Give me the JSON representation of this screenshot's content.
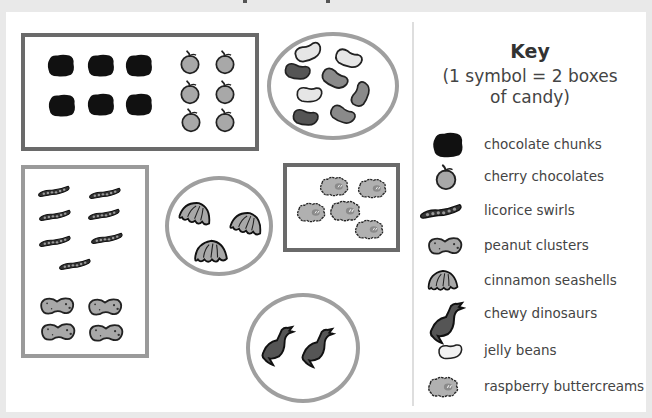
{
  "key": {
    "title": "Key",
    "scale_line1": "(1 symbol = 2 boxes",
    "scale_line2": "of candy)",
    "items": [
      {
        "icon": "chocolate-chunk-icon",
        "label": "chocolate chunks"
      },
      {
        "icon": "cherry-chocolate-icon",
        "label": "cherry chocolates"
      },
      {
        "icon": "licorice-swirl-icon",
        "label": "licorice swirls"
      },
      {
        "icon": "peanut-cluster-icon",
        "label": "peanut clusters"
      },
      {
        "icon": "cinnamon-seashell-icon",
        "label": "cinnamon seashells"
      },
      {
        "icon": "chewy-dinosaur-icon",
        "label": "chewy dinosaurs"
      },
      {
        "icon": "jelly-bean-icon",
        "label": "jelly beans"
      },
      {
        "icon": "raspberry-buttercream-icon",
        "label": "raspberry buttercreams"
      }
    ]
  },
  "groups": [
    {
      "container": "rectangle",
      "contents": [
        {
          "candy": "chocolate chunks",
          "symbols": 6
        },
        {
          "candy": "cherry chocolates",
          "symbols": 6
        }
      ]
    },
    {
      "container": "circle",
      "contents": [
        {
          "candy": "jelly beans",
          "symbols": 8
        }
      ]
    },
    {
      "container": "rectangle",
      "contents": [
        {
          "candy": "licorice swirls",
          "symbols": 7
        },
        {
          "candy": "peanut clusters",
          "symbols": 4
        }
      ]
    },
    {
      "container": "circle",
      "contents": [
        {
          "candy": "cinnamon seashells",
          "symbols": 3
        }
      ]
    },
    {
      "container": "rectangle",
      "contents": [
        {
          "candy": "raspberry buttercreams",
          "symbols": 5
        }
      ]
    },
    {
      "container": "circle",
      "contents": [
        {
          "candy": "chewy dinosaurs",
          "symbols": 2
        }
      ]
    }
  ],
  "colors": {
    "box_border_dark": "#6a6a6a",
    "box_border_light": "#9a9a9a",
    "circle_border": "#9f9f9f",
    "symbol_fill": "#a8a8a8",
    "chocolate_fill": "#111111"
  }
}
